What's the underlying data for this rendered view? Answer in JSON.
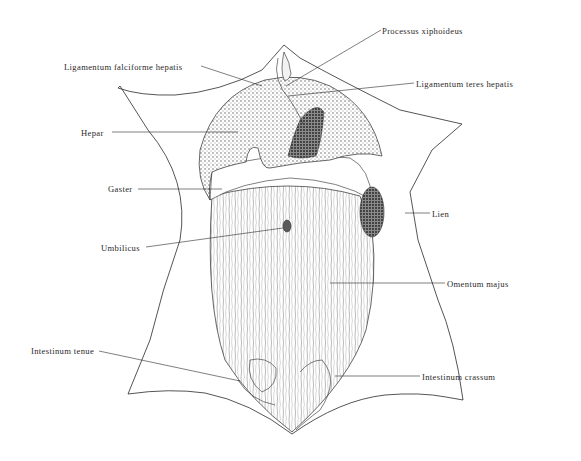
{
  "diagram": {
    "type": "anatomical-illustration",
    "colors": {
      "ink": "#2a2a2a",
      "background": "#ffffff",
      "shading": "#6f6f6f",
      "dark_shading": "#3a3a3a"
    },
    "labels": [
      {
        "id": "processus-xiphoideus",
        "text": "Processus xiphoideus",
        "x": 382,
        "y": 26
      },
      {
        "id": "ligamentum-falciforme-hepatis",
        "text": "Ligamentum falciforme hepatis",
        "x": 64,
        "y": 62
      },
      {
        "id": "ligamentum-teres-hepatis",
        "text": "Ligamentum teres hepatis",
        "x": 416,
        "y": 79
      },
      {
        "id": "hepar",
        "text": "Hepar",
        "x": 81,
        "y": 128
      },
      {
        "id": "gaster",
        "text": "Gaster",
        "x": 108,
        "y": 184
      },
      {
        "id": "lien",
        "text": "Lien",
        "x": 432,
        "y": 209
      },
      {
        "id": "umbilicus",
        "text": "Umbilicus",
        "x": 101,
        "y": 243
      },
      {
        "id": "omentum-majus",
        "text": "Omentum majus",
        "x": 447,
        "y": 279
      },
      {
        "id": "intestinum-tenue",
        "text": "Intestinum tenue",
        "x": 31,
        "y": 346
      },
      {
        "id": "intestinum-crassum",
        "text": "Intestinum crassum",
        "x": 422,
        "y": 372
      }
    ]
  }
}
